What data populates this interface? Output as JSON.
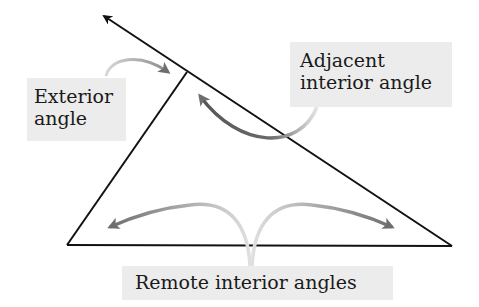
{
  "diagram": {
    "labels": {
      "exterior": [
        "Exterior",
        "angle"
      ],
      "adjacent": [
        "Adjacent",
        "interior angle"
      ],
      "remote": "Remote interior angles"
    },
    "colors": {
      "line": "#111111",
      "arrow": "#707070",
      "label_bg": "#ececec",
      "text": "#1a1a1a"
    },
    "geometry": {
      "vertex_top": [
        187,
        72
      ],
      "vertex_left": [
        67,
        245
      ],
      "vertex_right": [
        452,
        246
      ],
      "ray_tip": [
        102,
        15
      ]
    }
  }
}
